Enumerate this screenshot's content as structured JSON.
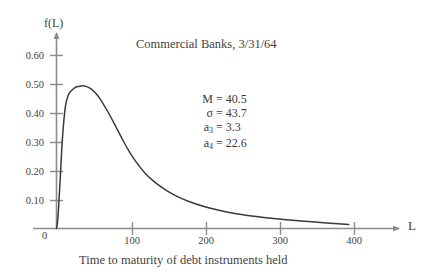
{
  "chart_data": {
    "type": "line",
    "title": "Commercial Banks, 3/31/64",
    "xlabel": "L",
    "ylabel": "f(L)",
    "caption": "Time to maturity of debt instruments held",
    "xlim": [
      0,
      420
    ],
    "ylim": [
      0,
      0.65
    ],
    "grid": false,
    "legend": "none",
    "x_ticks": [
      {
        "value": 0,
        "label": "0"
      },
      {
        "value": 100,
        "label": "100"
      },
      {
        "value": 200,
        "label": "200"
      },
      {
        "value": 300,
        "label": "300"
      },
      {
        "value": 400,
        "label": "400"
      }
    ],
    "y_ticks": [
      {
        "value": 0.1,
        "label": "0.10"
      },
      {
        "value": 0.2,
        "label": "0.20"
      },
      {
        "value": 0.3,
        "label": "0.30"
      },
      {
        "value": 0.4,
        "label": "0.40"
      },
      {
        "value": 0.5,
        "label": "0.50"
      },
      {
        "value": 0.6,
        "label": "0.60"
      }
    ],
    "series": [
      {
        "name": "f(L)",
        "color": "#3a3a3a",
        "x": [
          0,
          2,
          5,
          8,
          12,
          16,
          20,
          25,
          30,
          35,
          40,
          45,
          50,
          55,
          60,
          70,
          80,
          90,
          100,
          110,
          120,
          130,
          140,
          150,
          165,
          180,
          195,
          210,
          230,
          250,
          270,
          290,
          310,
          330,
          350,
          370,
          395
        ],
        "y": [
          0.0,
          0.04,
          0.17,
          0.31,
          0.42,
          0.46,
          0.475,
          0.486,
          0.49,
          0.492,
          0.49,
          0.484,
          0.474,
          0.46,
          0.443,
          0.4,
          0.352,
          0.303,
          0.258,
          0.221,
          0.19,
          0.166,
          0.146,
          0.129,
          0.108,
          0.092,
          0.079,
          0.069,
          0.057,
          0.048,
          0.041,
          0.035,
          0.03,
          0.026,
          0.022,
          0.018,
          0.014
        ]
      }
    ],
    "annotations": {
      "stats": [
        {
          "symbol": "M",
          "subscript": "",
          "value": "= 40.5"
        },
        {
          "symbol": "σ",
          "subscript": "",
          "value": "= 43.7"
        },
        {
          "symbol": "a",
          "subscript": "3",
          "value": "= 3.3"
        },
        {
          "symbol": "a",
          "subscript": "4",
          "value": "= 22.6"
        }
      ]
    },
    "axis_color": "#8c8c8c",
    "text_color": "#3f3f3f"
  }
}
